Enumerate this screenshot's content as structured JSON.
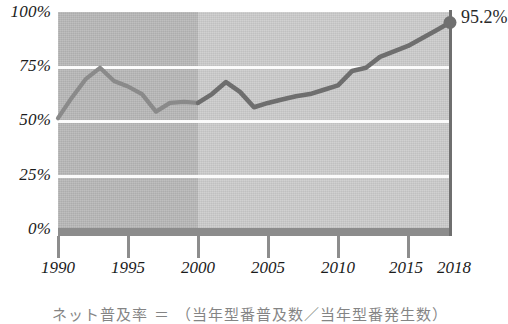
{
  "chart_data": {
    "type": "line",
    "title": "",
    "subtitle": "",
    "xlabel": "",
    "ylabel": "",
    "xlim": [
      1990,
      2018
    ],
    "ylim": [
      0,
      100
    ],
    "grid": true,
    "legend_position": "none",
    "x_ticks": [
      "1990",
      "1995",
      "2000",
      "2005",
      "2010",
      "2015",
      "2018"
    ],
    "y_ticks": [
      "0%",
      "25%",
      "50%",
      "75%",
      "100%"
    ],
    "annotations": [
      {
        "label": "95.2%",
        "x": 2018,
        "y": 95.2,
        "marker": "filled-circle"
      }
    ],
    "shaded_bands": [
      {
        "name": "band-1990-2000",
        "from": 1990,
        "to": 2000,
        "color": "#b9b9b9"
      },
      {
        "name": "band-2000-2018",
        "from": 2000,
        "to": 2018,
        "color": "#cdcdcd"
      }
    ],
    "x": [
      1990,
      1991,
      1992,
      1993,
      1994,
      1995,
      1996,
      1997,
      1998,
      1999,
      2000,
      2001,
      2002,
      2003,
      2004,
      2005,
      2006,
      2007,
      2008,
      2009,
      2010,
      2011,
      2012,
      2013,
      2014,
      2015,
      2016,
      2017,
      2018
    ],
    "series": [
      {
        "name": "rate",
        "color": "#8a8a8a",
        "values": [
          51.5,
          61.0,
          69.5,
          74.5,
          68.5,
          66.0,
          62.5,
          54.5,
          58.5,
          59.0,
          58.5,
          62.5,
          68.0,
          63.5,
          56.5,
          58.5,
          60.0,
          61.5,
          62.5,
          64.5,
          66.5,
          73.0,
          74.5,
          79.5,
          82.0,
          84.5,
          88.0,
          91.5,
          95.2
        ]
      }
    ]
  },
  "axis": {
    "y_labels": [
      "100%",
      "75%",
      "50%",
      "25%",
      "0%"
    ],
    "x_labels": [
      "1990",
      "1995",
      "2000",
      "2005",
      "2010",
      "2015",
      "2018"
    ]
  },
  "end_marker": {
    "value_label": "95.2%"
  },
  "caption": {
    "text": "ネット普及率 ＝ （当年型番普及数／当年型番発生数）"
  },
  "colors": {
    "band_early": "#b9b9b9",
    "band_late": "#cdcdcd",
    "gridline": "#fbfbfb",
    "line_early": "#8a8a8a",
    "line_late": "#6e6e6e",
    "baseline": "#8c8c8c",
    "text": "#1b1b1b"
  }
}
